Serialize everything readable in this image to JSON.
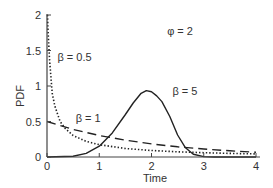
{
  "chart_data": {
    "type": "line",
    "title": "",
    "xlabel": "Time",
    "ylabel": "PDF",
    "xlim": [
      0,
      4
    ],
    "ylim": [
      0,
      2
    ],
    "xticks": [
      "0",
      "1",
      "2",
      "3",
      "4"
    ],
    "yticks": [
      "0",
      "0.5",
      "1",
      "1.5",
      "2"
    ],
    "grid": false,
    "legend": "none (inline annotations)",
    "annotations": [
      {
        "text": "φ = 2",
        "x": 2.3,
        "y": 1.72
      },
      {
        "text": "β = 0.5",
        "x": 0.2,
        "y": 1.35
      },
      {
        "text": "β = 5",
        "x": 2.4,
        "y": 0.88
      },
      {
        "text": "β = 1",
        "x": 0.55,
        "y": 0.5
      }
    ],
    "series": [
      {
        "name": "β = 0.5",
        "style": "dotted",
        "x": [
          0.01,
          0.02,
          0.05,
          0.1,
          0.15,
          0.25,
          0.35,
          0.5,
          0.75,
          1.0,
          1.5,
          2.0,
          2.5,
          3.0,
          3.5,
          4.0
        ],
        "values": [
          2.0,
          1.79,
          1.36,
          0.9,
          0.72,
          0.5,
          0.4,
          0.303,
          0.22,
          0.173,
          0.12,
          0.092,
          0.073,
          0.06,
          0.05,
          0.043
        ]
      },
      {
        "name": "β = 1",
        "style": "dashed",
        "x": [
          0,
          0.5,
          1.0,
          1.5,
          2.0,
          2.5,
          3.0,
          3.5,
          4.0
        ],
        "values": [
          0.5,
          0.389,
          0.303,
          0.236,
          0.184,
          0.143,
          0.112,
          0.087,
          0.068
        ]
      },
      {
        "name": "β = 5",
        "style": "solid",
        "x": [
          0,
          0.5,
          0.75,
          1.0,
          1.25,
          1.5,
          1.65,
          1.8,
          1.9,
          2.0,
          2.1,
          2.2,
          2.35,
          2.5,
          2.65,
          2.8,
          3.0,
          3.2,
          4.0
        ],
        "values": [
          0,
          0.01,
          0.05,
          0.152,
          0.34,
          0.598,
          0.76,
          0.897,
          0.935,
          0.92,
          0.86,
          0.78,
          0.57,
          0.31,
          0.13,
          0.04,
          0.005,
          0.0,
          0.0
        ]
      }
    ],
    "parameters": {
      "phi": 2,
      "betas": [
        0.5,
        1,
        5
      ]
    }
  }
}
